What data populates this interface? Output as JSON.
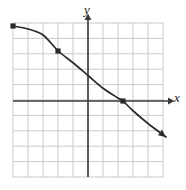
{
  "figure": {
    "width": 186,
    "height": 190,
    "background_color": "#ffffff"
  },
  "axes": {
    "x_label": "x",
    "y_label": "y",
    "axis_color": "#3a3a3a",
    "origin_px": {
      "x": 88,
      "y": 101
    },
    "unit_px": 15,
    "x_range": [
      -5,
      5
    ],
    "y_range": [
      -5,
      5
    ],
    "x_axis_arrow": true,
    "y_axis_arrow": true
  },
  "grid": {
    "visible": true,
    "color": "#c9c9cf",
    "left_px": 13,
    "top_px": 23,
    "right_px": 163,
    "bottom_px": 177,
    "columns": 10,
    "rows": 10,
    "cell_px": 15
  },
  "chart_data": {
    "type": "line",
    "title": "",
    "xlabel": "x",
    "ylabel": "y",
    "xlim": [
      -5,
      5
    ],
    "ylim": [
      -5,
      5
    ],
    "grid": true,
    "legend": "none",
    "series": [
      {
        "name": "curve",
        "color": "#2b2b2b",
        "style": "solid",
        "arrow_end": true,
        "x": [
          -5.0,
          -4.0,
          -3.0,
          -2.0,
          -1.0,
          0.0,
          1.0,
          2.0,
          2.33,
          3.0,
          4.0,
          5.2
        ],
        "y": [
          5.0,
          4.8,
          4.4,
          3.35,
          2.55,
          1.7,
          0.85,
          0.2,
          0.0,
          -0.65,
          -1.5,
          -2.4
        ]
      }
    ],
    "points": [
      {
        "label": "endpoint-left",
        "x": -5.0,
        "y": 5.0,
        "px": 13,
        "py": 23,
        "marker": "filled-square"
      },
      {
        "label": "midpoint",
        "x": -2.0,
        "y": 3.33,
        "px": 58,
        "py": 51,
        "marker": "filled-square"
      },
      {
        "label": "x-intercept",
        "x": 2.33,
        "y": 0.0,
        "px": 123,
        "py": 101,
        "marker": "filled-square"
      }
    ],
    "annotations": []
  }
}
